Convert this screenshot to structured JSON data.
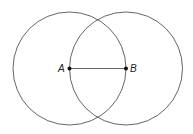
{
  "diagram": {
    "points": [
      {
        "label": "A",
        "x": 69.5,
        "y": 68.5
      },
      {
        "label": "B",
        "x": 126,
        "y": 68.5
      }
    ],
    "circles": [
      {
        "center": "A",
        "radius": 56.5
      },
      {
        "center": "B",
        "radius": 56.5
      }
    ],
    "segments": [
      {
        "from": "A",
        "to": "B"
      }
    ],
    "colors": {
      "stroke": "#555555",
      "point": "#111111",
      "background": "#ffffff"
    }
  }
}
